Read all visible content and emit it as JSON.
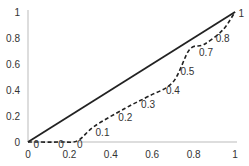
{
  "chart_data": {
    "type": "line",
    "title": "",
    "xlabel": "",
    "ylabel": "",
    "xlim": [
      0,
      1
    ],
    "ylim": [
      0,
      1
    ],
    "grid": false,
    "legend": null,
    "x_ticks": [
      "0",
      "0.2",
      "0.4",
      "0.6",
      "0.8",
      "1"
    ],
    "y_ticks": [
      "0",
      "0.2",
      "0.4",
      "0.6",
      "0.8",
      "1"
    ],
    "series": [
      {
        "name": "diagonal",
        "style": "solid",
        "color": "#222222",
        "x": [
          0,
          1
        ],
        "y": [
          0,
          1
        ]
      },
      {
        "name": "curve",
        "style": "dashed",
        "color": "#222222",
        "x": [
          0,
          0.16,
          0.24,
          0.32,
          0.47,
          0.58,
          0.7,
          0.78,
          0.85,
          0.94,
          1.0
        ],
        "y": [
          0,
          0,
          0.01,
          0.12,
          0.26,
          0.35,
          0.46,
          0.71,
          0.75,
          0.86,
          1.0
        ]
      }
    ],
    "annotations": [
      {
        "text": "0",
        "x": 0.04,
        "y": -0.02
      },
      {
        "text": "0",
        "x": 0.16,
        "y": -0.02
      },
      {
        "text": "0",
        "x": 0.25,
        "y": -0.02
      },
      {
        "text": "0.1",
        "x": 0.36,
        "y": 0.07
      },
      {
        "text": "0.2",
        "x": 0.47,
        "y": 0.19
      },
      {
        "text": "0.3",
        "x": 0.58,
        "y": 0.29
      },
      {
        "text": "0.4",
        "x": 0.7,
        "y": 0.4
      },
      {
        "text": "0.5",
        "x": 0.77,
        "y": 0.54
      },
      {
        "text": "0.7",
        "x": 0.86,
        "y": 0.69
      },
      {
        "text": "0.8",
        "x": 0.94,
        "y": 0.8
      },
      {
        "text": "1",
        "x": 1.03,
        "y": 0.99
      }
    ]
  }
}
